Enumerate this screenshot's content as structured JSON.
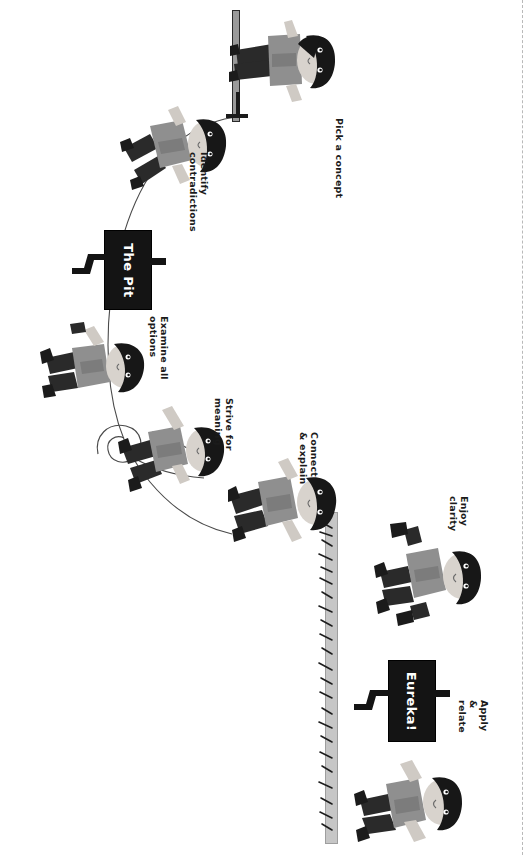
{
  "illustration": {
    "title": "The Learning Pit",
    "orientation": "rotated-90",
    "background_color": "#ffffff",
    "ink_color": "#1b1b1b",
    "sign_color": "#141414",
    "sign_text_color": "#ffffff",
    "skin_color": "#d8d3cd",
    "hair_color": "#1a1a1a",
    "shirt_color": "#8c8c8c",
    "trouser_color": "#2a2a2a"
  },
  "stages": [
    {
      "id": "pick-a-concept",
      "label": "Pick a concept",
      "order": 1,
      "character": "standing figure at the start, beside a post"
    },
    {
      "id": "identify-contradictions",
      "label": "Identify\ncontradictions",
      "order": 2,
      "character": "figure stepping down into the pit"
    },
    {
      "id": "examine-all-options",
      "label": "Examine all\noptions",
      "order": 3,
      "character": "figure crouched at the bottom of the pit"
    },
    {
      "id": "strive-for-meaning",
      "label": "Strive for\nmeaning",
      "order": 4,
      "character": "figure climbing with a rope"
    },
    {
      "id": "connect-explain",
      "label": "Connect\n& explain",
      "order": 5,
      "character": "figure climbing out of the pit"
    },
    {
      "id": "enjoy-clarity",
      "label": "Enjoy clarity",
      "order": 6,
      "character": "figure celebrating with raised arms"
    },
    {
      "id": "apply-relate",
      "label": "Apply &\nrelate",
      "order": 7,
      "character": "figure walking away at the end"
    }
  ],
  "signs": [
    {
      "id": "the-pit-sign",
      "text": "The Pit"
    },
    {
      "id": "eureka-sign",
      "text": "Eureka!"
    }
  ]
}
